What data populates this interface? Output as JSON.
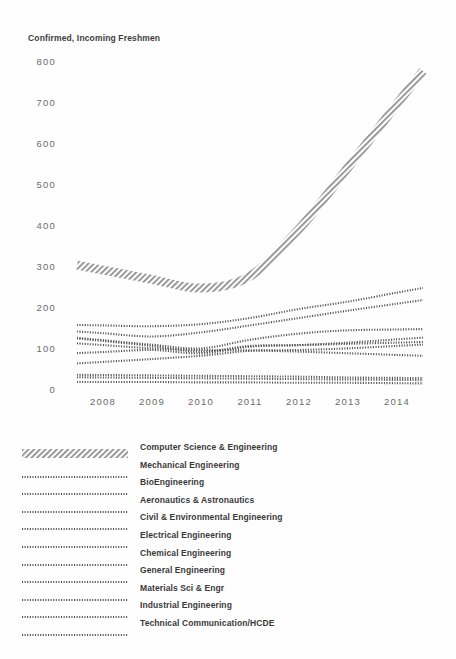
{
  "chart_data": {
    "type": "line",
    "title": "Confirmed, Incoming Freshmen",
    "xlabel": "",
    "ylabel": "",
    "ylim": [
      0,
      800
    ],
    "ytick_values": [
      800,
      700,
      600,
      500,
      400,
      300,
      200,
      100,
      0
    ],
    "ytick_labels": [
      "800",
      "700",
      "600",
      "500",
      "400",
      "300",
      "200",
      "100",
      "0"
    ],
    "categories": [
      "2008",
      "2009",
      "2010",
      "2011",
      "2012",
      "2013",
      "2014"
    ],
    "x": [
      2008,
      2009,
      2010,
      2011,
      2012,
      2013,
      2014
    ],
    "grid": false,
    "legend_position": "below",
    "series": [
      {
        "name": "Computer Science & Engineering",
        "style": "hatched-band",
        "values": [
          295,
          272,
          251,
          280,
          395,
          545,
          700
        ]
      },
      {
        "name": "Mechanical Engineering",
        "style": "dotted",
        "values": [
          160,
          158,
          163,
          178,
          200,
          218,
          240
        ]
      },
      {
        "name": "BioEngineering",
        "style": "dotted",
        "values": [
          141,
          133,
          143,
          160,
          178,
          196,
          213
        ]
      },
      {
        "name": "Aeronautics & Astronautics",
        "style": "dotted",
        "values": [
          124,
          113,
          104,
          125,
          140,
          148,
          150
        ]
      },
      {
        "name": "Civil & Environmental Engineering",
        "style": "dotted",
        "values": [
          95,
          100,
          92,
          108,
          112,
          118,
          126
        ]
      },
      {
        "name": "Electrical Engineering",
        "style": "dotted",
        "values": [
          122,
          110,
          96,
          110,
          112,
          115,
          118
        ]
      },
      {
        "name": "Chemical Engineering",
        "style": "dotted",
        "values": [
          71,
          78,
          86,
          98,
          100,
          104,
          110
        ]
      },
      {
        "name": "General Engineering",
        "style": "dotted",
        "values": [
          112,
          104,
          100,
          99,
          96,
          92,
          88
        ]
      },
      {
        "name": "Materials Sci & Engr",
        "style": "dotted",
        "values": [
          39,
          38,
          37,
          36,
          35,
          33,
          32
        ]
      },
      {
        "name": "Industrial Engineering",
        "style": "dotted",
        "values": [
          33,
          32,
          31,
          30,
          29,
          28,
          27
        ]
      },
      {
        "name": "Technical Communication/HCDE",
        "style": "dotted",
        "values": [
          22,
          22,
          21,
          21,
          20,
          20,
          19
        ]
      }
    ]
  },
  "legend": {
    "items": [
      {
        "label": "Computer Science & Engineering",
        "style": "hatched-band"
      },
      {
        "label": "Mechanical Engineering",
        "style": "dotted"
      },
      {
        "label": "BioEngineering",
        "style": "dotted"
      },
      {
        "label": "Aeronautics & Astronautics",
        "style": "dotted"
      },
      {
        "label": "Civil & Environmental Engineering",
        "style": "dotted"
      },
      {
        "label": "Electrical Engineering",
        "style": "dotted"
      },
      {
        "label": "Chemical Engineering",
        "style": "dotted"
      },
      {
        "label": "General Engineering",
        "style": "dotted"
      },
      {
        "label": "Materials Sci & Engr",
        "style": "dotted"
      },
      {
        "label": "Industrial Engineering",
        "style": "dotted"
      },
      {
        "label": "Technical Communication/HCDE",
        "style": "dotted"
      }
    ]
  },
  "colors": {
    "ink": "#3a3a3a",
    "tick": "#6b6b6b",
    "series": "#555555",
    "background": "#fefefe"
  }
}
